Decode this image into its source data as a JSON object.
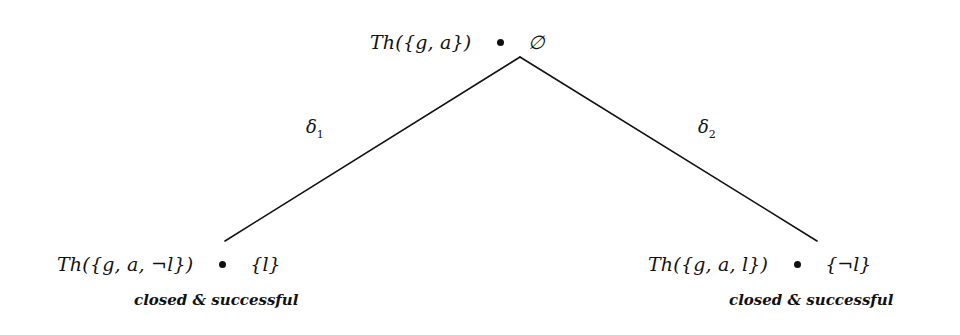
{
  "diagram": {
    "type": "tableau-tree",
    "background_color": "#ffffff",
    "ink_color": "#111111",
    "root": {
      "theory_label": "Th({g, a})",
      "dot": "node-dot",
      "set_label": "∅"
    },
    "edges": [
      {
        "name": "left-branch",
        "label": "δ",
        "subscript": "1"
      },
      {
        "name": "right-branch",
        "label": "δ",
        "subscript": "2"
      }
    ],
    "leaves": [
      {
        "theory_label": "Th({g, a, ¬l})",
        "dot": "node-dot",
        "set_label": "{l}",
        "caption": "closed & successful"
      },
      {
        "theory_label": "Th({g, a, l})",
        "dot": "node-dot",
        "set_label": "{¬l}",
        "caption": "closed & successful"
      }
    ]
  }
}
